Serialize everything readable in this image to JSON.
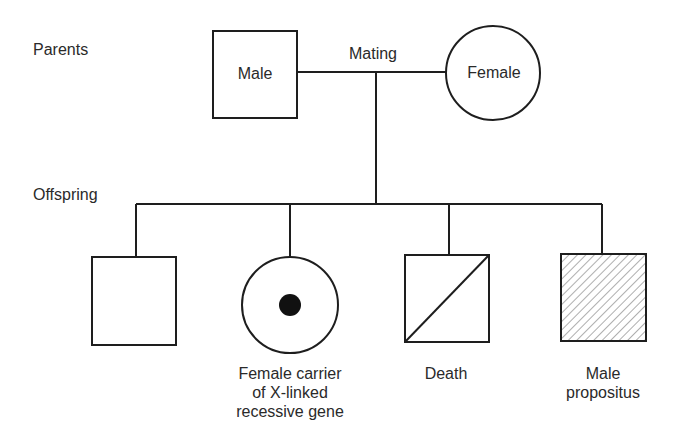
{
  "diagram": {
    "type": "pedigree",
    "row_labels": {
      "parents": "Parents",
      "offspring": "Offspring"
    },
    "parents": {
      "male": {
        "shape": "square",
        "label": "Male"
      },
      "female": {
        "shape": "circle",
        "label": "Female"
      },
      "mating_label": "Mating"
    },
    "offspring": [
      {
        "shape": "square",
        "fill": "empty",
        "caption": []
      },
      {
        "shape": "circle",
        "fill": "center-dot",
        "caption": [
          "Female carrier",
          "of X-linked",
          "recessive gene"
        ]
      },
      {
        "shape": "square",
        "fill": "diagonal-slash",
        "caption": [
          "Death"
        ]
      },
      {
        "shape": "square",
        "fill": "hatched",
        "caption": [
          "Male",
          "propositus"
        ]
      }
    ],
    "colors": {
      "line": "#1e1e1e",
      "text": "#2a2a2a",
      "background": "#ffffff",
      "hatch": "#777777"
    }
  }
}
